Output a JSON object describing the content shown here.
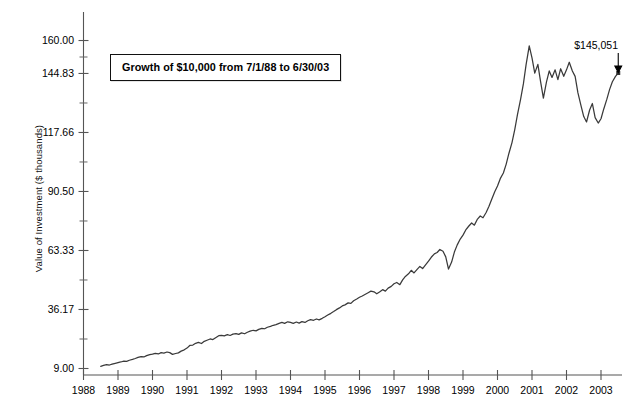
{
  "chart_data": {
    "type": "line",
    "title": "",
    "annotation": "Growth of $10,000 from 7/1/88 to 6/30/03",
    "xlabel": "",
    "ylabel": "Value of Investment ($ thousands)",
    "xlim": [
      1988.5,
      2003.5
    ],
    "ylim": [
      9.0,
      163.0
    ],
    "grid": false,
    "legend": null,
    "y_ticks": [
      9.0,
      36.17,
      63.33,
      90.5,
      117.66,
      144.83,
      160.0
    ],
    "y_tick_labels": [
      "9.00",
      "36.17",
      "63.33",
      "90.50",
      "117.66",
      "144.83",
      "160.00"
    ],
    "y_minor_ticks": [
      22.58,
      49.75,
      76.91,
      104.08,
      131.24,
      152.41
    ],
    "x_ticks": [
      1988,
      1989,
      1990,
      1991,
      1992,
      1993,
      1994,
      1995,
      1996,
      1997,
      1998,
      1999,
      2000,
      2001,
      2002,
      2003
    ],
    "x_tick_labels": [
      "1988",
      "1989",
      "1990",
      "1991",
      "1992",
      "1993",
      "1994",
      "1995",
      "1996",
      "1997",
      "1998",
      "1999",
      "2000",
      "2001",
      "2002",
      "2003"
    ],
    "end_label": "$145,051",
    "end_point": {
      "x": 2003.5,
      "y": 145.051
    },
    "series": [
      {
        "name": "Growth of $10,000",
        "x": [
          1988.5,
          1988.58,
          1988.67,
          1988.75,
          1988.83,
          1988.92,
          1989.0,
          1989.08,
          1989.17,
          1989.25,
          1989.33,
          1989.42,
          1989.5,
          1989.58,
          1989.67,
          1989.75,
          1989.83,
          1989.92,
          1990.0,
          1990.08,
          1990.17,
          1990.25,
          1990.33,
          1990.42,
          1990.5,
          1990.58,
          1990.67,
          1990.75,
          1990.83,
          1990.92,
          1991.0,
          1991.08,
          1991.17,
          1991.25,
          1991.33,
          1991.42,
          1991.5,
          1991.58,
          1991.67,
          1991.75,
          1991.83,
          1991.92,
          1992.0,
          1992.08,
          1992.17,
          1992.25,
          1992.33,
          1992.42,
          1992.5,
          1992.58,
          1992.67,
          1992.75,
          1992.83,
          1992.92,
          1993.0,
          1993.08,
          1993.17,
          1993.25,
          1993.33,
          1993.42,
          1993.5,
          1993.58,
          1993.67,
          1993.75,
          1993.83,
          1993.92,
          1994.0,
          1994.08,
          1994.17,
          1994.25,
          1994.33,
          1994.42,
          1994.5,
          1994.58,
          1994.67,
          1994.75,
          1994.83,
          1994.92,
          1995.0,
          1995.08,
          1995.17,
          1995.25,
          1995.33,
          1995.42,
          1995.5,
          1995.58,
          1995.67,
          1995.75,
          1995.83,
          1995.92,
          1996.0,
          1996.08,
          1996.17,
          1996.25,
          1996.33,
          1996.42,
          1996.5,
          1996.58,
          1996.67,
          1996.75,
          1996.83,
          1996.92,
          1997.0,
          1997.08,
          1997.17,
          1997.25,
          1997.33,
          1997.42,
          1997.5,
          1997.58,
          1997.67,
          1997.75,
          1997.83,
          1997.92,
          1998.0,
          1998.08,
          1998.17,
          1998.25,
          1998.33,
          1998.42,
          1998.5,
          1998.58,
          1998.67,
          1998.75,
          1998.83,
          1998.92,
          1999.0,
          1999.08,
          1999.17,
          1999.25,
          1999.33,
          1999.42,
          1999.5,
          1999.58,
          1999.67,
          1999.75,
          1999.83,
          1999.92,
          2000.0,
          2000.08,
          2000.17,
          2000.25,
          2000.33,
          2000.42,
          2000.5,
          2000.58,
          2000.67,
          2000.75,
          2000.83,
          2000.92,
          2001.0,
          2001.08,
          2001.17,
          2001.25,
          2001.33,
          2001.42,
          2001.5,
          2001.58,
          2001.67,
          2001.75,
          2001.83,
          2001.92,
          2002.0,
          2002.08,
          2002.17,
          2002.25,
          2002.33,
          2002.42,
          2002.5,
          2002.58,
          2002.67,
          2002.75,
          2002.83,
          2002.92,
          2003.0,
          2003.08,
          2003.17,
          2003.25,
          2003.33,
          2003.42,
          2003.5
        ],
        "values": [
          10.0,
          10.4,
          10.8,
          10.6,
          11.0,
          11.4,
          11.7,
          12.0,
          12.4,
          12.3,
          12.8,
          13.2,
          13.6,
          14.1,
          14.5,
          14.3,
          14.9,
          15.4,
          15.6,
          16.0,
          15.7,
          16.3,
          16.1,
          16.6,
          16.3,
          15.5,
          15.9,
          16.2,
          17.0,
          17.6,
          18.4,
          19.6,
          19.8,
          20.6,
          21.0,
          20.5,
          21.5,
          22.0,
          22.6,
          22.3,
          23.2,
          24.1,
          24.3,
          24.0,
          24.6,
          24.2,
          24.8,
          25.1,
          24.7,
          25.4,
          25.0,
          25.7,
          26.2,
          26.6,
          26.3,
          27.0,
          27.5,
          27.3,
          28.0,
          28.4,
          28.9,
          29.2,
          29.8,
          30.2,
          29.8,
          30.5,
          30.2,
          29.8,
          30.4,
          29.9,
          30.6,
          30.2,
          31.0,
          31.5,
          31.2,
          31.8,
          31.4,
          32.1,
          32.8,
          33.6,
          34.4,
          35.2,
          36.1,
          36.9,
          37.8,
          38.3,
          39.2,
          39.0,
          40.2,
          41.0,
          41.8,
          42.4,
          43.2,
          43.9,
          44.6,
          44.3,
          43.4,
          44.2,
          45.3,
          44.6,
          46.0,
          46.8,
          48.0,
          48.6,
          47.6,
          49.8,
          51.4,
          52.6,
          54.2,
          53.0,
          54.6,
          56.0,
          55.0,
          56.8,
          58.4,
          60.2,
          61.8,
          62.4,
          63.8,
          63.0,
          60.4,
          54.8,
          58.0,
          62.6,
          65.8,
          68.6,
          70.4,
          72.8,
          74.6,
          76.0,
          75.0,
          77.8,
          79.2,
          78.4,
          80.8,
          83.6,
          86.8,
          90.4,
          93.0,
          96.4,
          99.0,
          103.0,
          108.0,
          113.0,
          119.0,
          126.0,
          133.0,
          140.0,
          149.0,
          157.5,
          152.0,
          145.0,
          149.0,
          141.0,
          133.5,
          141.0,
          146.0,
          143.0,
          146.5,
          142.0,
          147.0,
          143.5,
          146.5,
          150.0,
          146.0,
          143.5,
          136.0,
          130.0,
          125.0,
          122.5,
          128.0,
          131.0,
          124.5,
          122.0,
          124.0,
          128.5,
          133.0,
          137.5,
          141.0,
          143.5,
          145.051
        ]
      }
    ]
  },
  "axis": {
    "ylabel": "Value of Investment ($ thousands)"
  },
  "annotation": {
    "text": "Growth of $10,000 from 7/1/88 to 6/30/03"
  },
  "callout": {
    "label": "$145,051"
  }
}
